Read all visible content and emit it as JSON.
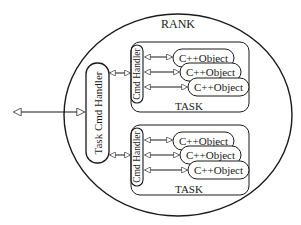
{
  "diagram": {
    "rank": {
      "label": "RANK"
    },
    "task_cmd_handler": {
      "label": "Task Cmd Handler"
    },
    "tasks": [
      {
        "label": "TASK",
        "cmd_handler": {
          "label": "Cmd Handler"
        },
        "objects": [
          {
            "label": "C++Object"
          },
          {
            "label": "C++Object"
          },
          {
            "label": "C++Object"
          }
        ]
      },
      {
        "label": "TASK",
        "cmd_handler": {
          "label": "Cmd Handler"
        },
        "objects": [
          {
            "label": "C++Object"
          },
          {
            "label": "C++Object"
          },
          {
            "label": "C++Object"
          }
        ]
      }
    ],
    "colors": {
      "line": "#1a1a1a",
      "background": "#ffffff"
    }
  }
}
